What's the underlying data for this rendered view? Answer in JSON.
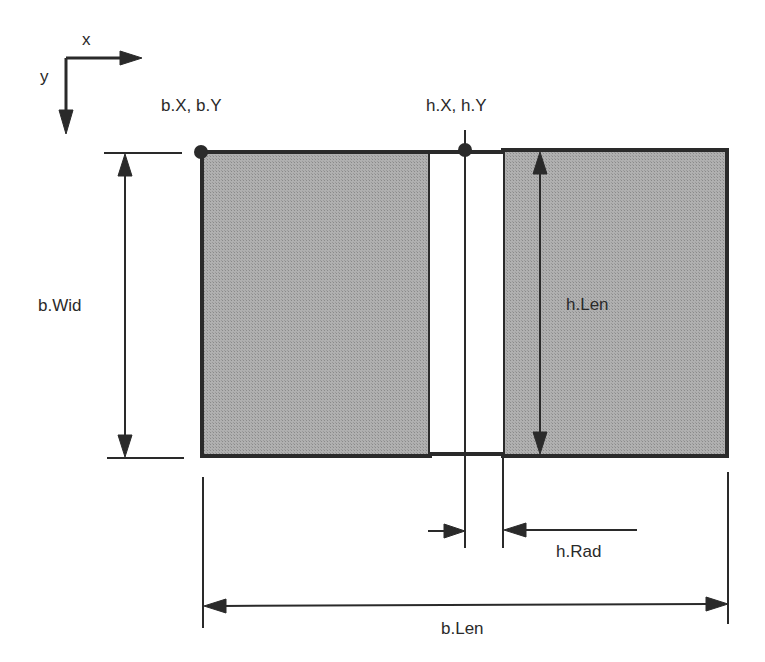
{
  "diagram": {
    "type": "dimension-drawing",
    "axes": {
      "x_label": "x",
      "y_label": "y"
    },
    "labels": {
      "base_origin": "b.X, b.Y",
      "hole_origin": "h.X, h.Y",
      "base_width": "b.Wid",
      "hole_length": "h.Len",
      "hole_radius": "h.Rad",
      "base_length": "b.Len"
    },
    "colors": {
      "fill": "#a8a8a8",
      "stroke": "#2a2a2a",
      "background": "#ffffff",
      "slot": "#ffffff"
    }
  }
}
